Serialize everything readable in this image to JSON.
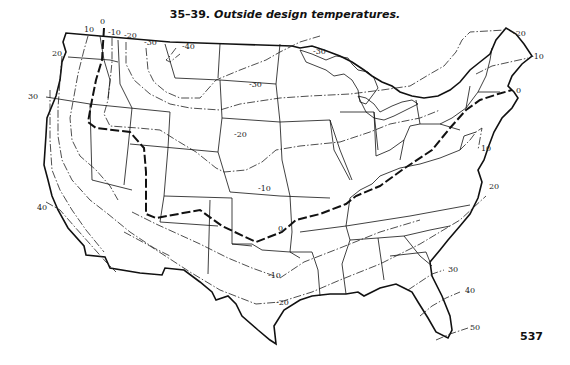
{
  "figure": {
    "number": "35–39.",
    "caption": "Outside design temperatures."
  },
  "page_number": "537",
  "isotherm_labels": [
    {
      "value": "0",
      "x": 100,
      "y": 24
    },
    {
      "value": "10",
      "x": 84,
      "y": 32
    },
    {
      "value": "-10",
      "x": 108,
      "y": 35
    },
    {
      "value": "-20",
      "x": 124,
      "y": 38
    },
    {
      "value": "-30",
      "x": 144,
      "y": 45
    },
    {
      "value": "-40",
      "x": 182,
      "y": 49
    },
    {
      "value": "20",
      "x": 52,
      "y": 56
    },
    {
      "value": "30",
      "x": 28,
      "y": 99
    },
    {
      "value": "-30",
      "x": 313,
      "y": 54
    },
    {
      "value": "-30",
      "x": 249,
      "y": 87
    },
    {
      "value": "-20",
      "x": 234,
      "y": 137
    },
    {
      "value": "-10",
      "x": 258,
      "y": 191
    },
    {
      "value": "0",
      "x": 278,
      "y": 231
    },
    {
      "value": "40",
      "x": 37,
      "y": 210
    },
    {
      "value": "-10",
      "x": 268,
      "y": 278
    },
    {
      "value": "-20",
      "x": 276,
      "y": 305
    },
    {
      "value": "-20",
      "x": 513,
      "y": 36
    },
    {
      "value": "-10",
      "x": 531,
      "y": 59
    },
    {
      "value": "0",
      "x": 516,
      "y": 93
    },
    {
      "value": "10",
      "x": 481,
      "y": 151
    },
    {
      "value": "20",
      "x": 489,
      "y": 189
    },
    {
      "value": "30",
      "x": 448,
      "y": 272
    },
    {
      "value": "40",
      "x": 465,
      "y": 293
    },
    {
      "value": "50",
      "x": 470,
      "y": 330
    }
  ]
}
